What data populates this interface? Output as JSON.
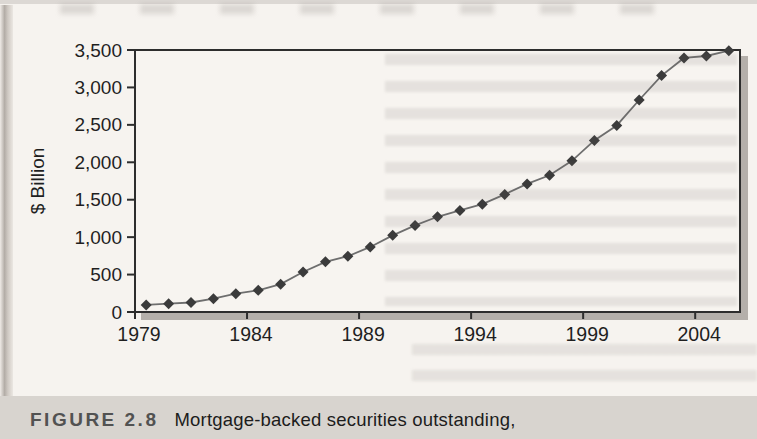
{
  "figure": {
    "label": "FIGURE 2.8",
    "caption": "Mortgage-backed securities outstanding,"
  },
  "chart_data": {
    "type": "line",
    "title": "Mortgage-backed securities outstanding",
    "xlabel": "",
    "ylabel": "$ Billion",
    "x": [
      1979,
      1980,
      1981,
      1982,
      1983,
      1984,
      1985,
      1986,
      1987,
      1988,
      1989,
      1990,
      1991,
      1992,
      1993,
      1994,
      1995,
      1996,
      1997,
      1998,
      1999,
      2000,
      2001,
      2002,
      2003,
      2004,
      2005
    ],
    "series": [
      {
        "name": "Mortgage-backed securities outstanding ($ billion)",
        "values": [
          95,
          111,
          127,
          178,
          244,
          289,
          372,
          534,
          670,
          745,
          869,
          1024,
          1157,
          1272,
          1357,
          1441,
          1571,
          1711,
          1826,
          2019,
          2292,
          2492,
          2832,
          3158,
          3394,
          3420,
          3490
        ]
      }
    ],
    "ylim": [
      0,
      3500
    ],
    "yticks": [
      0,
      500,
      1000,
      1500,
      2000,
      2500,
      3000,
      3500
    ],
    "xticks": [
      1979,
      1984,
      1989,
      1994,
      1999,
      2004
    ],
    "grid": false,
    "legend_position": "none",
    "marker": "diamond",
    "line_color": "#6e6e6e",
    "marker_color": "#3b3b3b"
  },
  "colors": {
    "page_bg": "#f5f2ee",
    "plot_bg": "#f7f4f0",
    "frame": "#2d2d2d",
    "shadow": "#b4afaa",
    "caption_band_bg": "#d8d4cf",
    "figure_label_text": "#525252",
    "caption_text": "#1c1c1c",
    "tick_text": "#1f1f1f"
  }
}
